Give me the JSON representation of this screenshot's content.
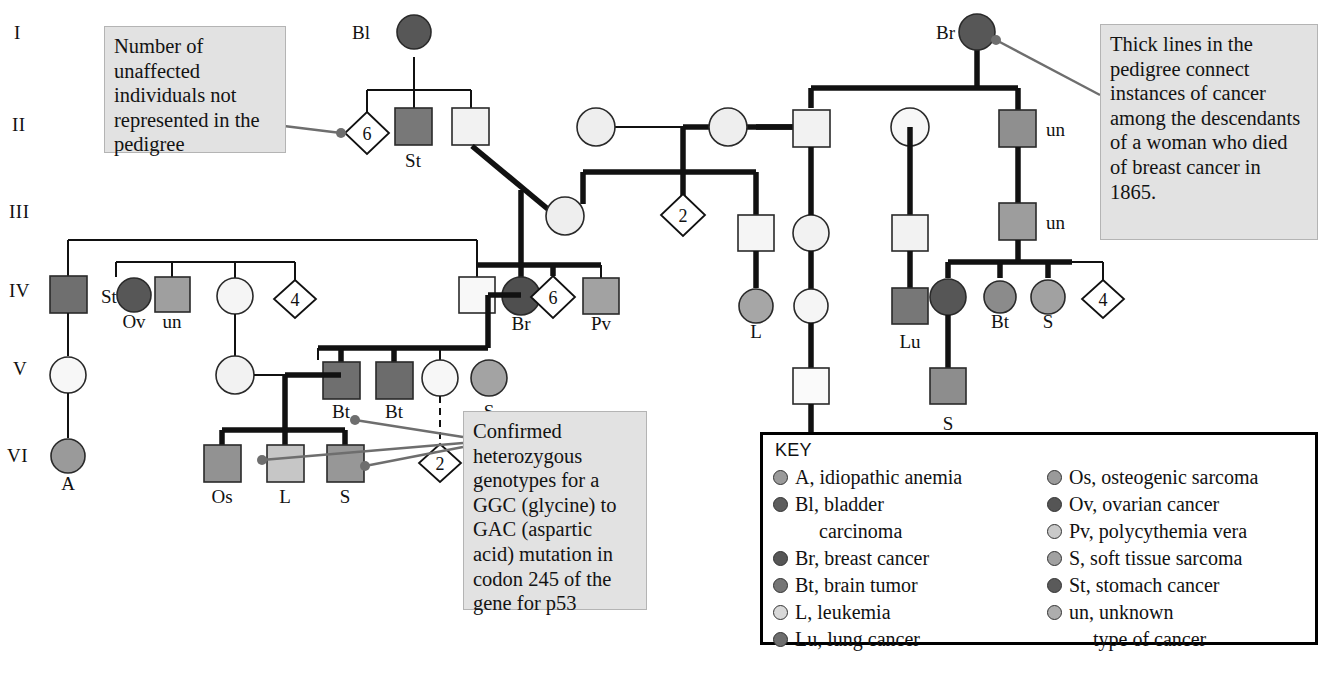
{
  "generations": [
    "I",
    "II",
    "III",
    "IV",
    "V",
    "VI"
  ],
  "callouts": {
    "unaffected": "Number of unaffected individuals not represented in the pedigree",
    "thicklines": "Thick lines in the pedigree connect instances of cancer among the descendants of a woman who died of breast cancer in 1865.",
    "genotypes": "Confirmed heterozygous genotypes for a GGC (glycine) to GAC (aspartic acid) mutation in codon 245 of the gene for p53"
  },
  "key": {
    "title": "KEY",
    "left": [
      {
        "code": "A",
        "label": "A, idiopathic anemia",
        "color": "#9a9a9a"
      },
      {
        "code": "Bl",
        "label": "Bl, bladder",
        "cont": "carcinoma",
        "color": "#5d5d5d"
      },
      {
        "code": "Br",
        "label": "Br, breast cancer",
        "color": "#565656"
      },
      {
        "code": "Bt",
        "label": "Bt, brain tumor",
        "color": "#757575"
      },
      {
        "code": "L",
        "label": "L, leukemia",
        "color": "#d8d8d8"
      },
      {
        "code": "Lu",
        "label": "Lu, lung cancer",
        "color": "#6e6e6e"
      }
    ],
    "right": [
      {
        "code": "Os",
        "label": "Os, osteogenic sarcoma",
        "color": "#9a9a9a"
      },
      {
        "code": "Ov",
        "label": "Ov, ovarian cancer",
        "color": "#555555"
      },
      {
        "code": "Pv",
        "label": "Pv, polycythemia vera",
        "color": "#c9c9c9"
      },
      {
        "code": "S",
        "label": "S, soft tissue sarcoma",
        "color": "#a1a1a1"
      },
      {
        "code": "St",
        "label": "St, stomach cancer",
        "color": "#5a5a5a"
      },
      {
        "code": "un",
        "label": "un, unknown",
        "cont": "type of cancer",
        "color": "#adadad"
      }
    ]
  },
  "labels": {
    "bl": "Bl",
    "st": "St",
    "br_gen1": "Br",
    "un_a": "un",
    "un_b": "un",
    "br_iv": "Br",
    "bt_right": "Bt",
    "s_right": "S",
    "s_v_right": "S",
    "st_iv": "St",
    "ov": "Ov",
    "un_iv": "un",
    "pv": "Pv",
    "l_iv": "L",
    "lu": "Lu",
    "bt1": "Bt",
    "bt2": "Bt",
    "s_v": "S",
    "a": "A",
    "os": "Os",
    "l_vi": "L",
    "s_vi": "S",
    "l_bottom": "L"
  },
  "diamonds": {
    "d6a": "6",
    "d2a": "2",
    "d4a": "4",
    "d6b": "6",
    "d4b": "4",
    "d2b": "2"
  },
  "colors": {
    "dark": "#575757",
    "mid": "#787878",
    "light": "#c7c7c7",
    "pale": "#e6e6e6",
    "white": "#f2f2f2",
    "line": "#111111",
    "callout_bg": "#e2e2e2",
    "leader": "#6e6e6e"
  },
  "caption": ""
}
